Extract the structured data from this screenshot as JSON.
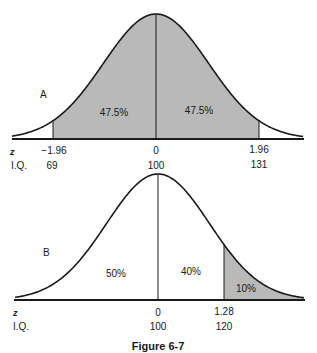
{
  "colors": {
    "shade": "#b9b9b9",
    "line": "#1a1a1a",
    "background": "#ffffff"
  },
  "panels": {
    "A": {
      "label": "A",
      "regions": [
        {
          "label": "47.5%",
          "from_z": -1.96,
          "to_z": 0,
          "shaded": true
        },
        {
          "label": "47.5%",
          "from_z": 0,
          "to_z": 1.96,
          "shaded": true
        }
      ],
      "axis": {
        "z_label": "z",
        "iq_label": "I.Q.",
        "ticks": [
          {
            "z": "−1.96",
            "iq": "69"
          },
          {
            "z": "0",
            "iq": "100"
          },
          {
            "z": "1.96",
            "iq": "131"
          }
        ]
      }
    },
    "B": {
      "label": "B",
      "regions": [
        {
          "label": "50%",
          "from_z": null,
          "to_z": 0,
          "shaded": false
        },
        {
          "label": "40%",
          "from_z": 0,
          "to_z": 1.28,
          "shaded": false
        },
        {
          "label": "10%",
          "from_z": 1.28,
          "to_z": null,
          "shaded": true
        }
      ],
      "axis": {
        "z_label": "z",
        "iq_label": "I.Q.",
        "ticks": [
          {
            "z": "0",
            "iq": "100"
          },
          {
            "z": "1.28",
            "iq": "120"
          }
        ]
      }
    }
  },
  "caption": "Figure 6-7",
  "chart_data": [
    {
      "type": "area",
      "title": "A",
      "description": "Normal curve, shaded between z = -1.96 and z = 1.96",
      "x": [
        -1.96,
        0,
        1.96
      ],
      "x_iq": [
        69,
        100,
        131
      ],
      "regions": [
        {
          "from": -1.96,
          "to": 0,
          "percent": 47.5,
          "shaded": true
        },
        {
          "from": 0,
          "to": 1.96,
          "percent": 47.5,
          "shaded": true
        }
      ],
      "xlabel": "z / I.Q.",
      "ylabel": ""
    },
    {
      "type": "area",
      "title": "B",
      "description": "Normal curve, upper tail shaded above z = 1.28",
      "x": [
        0,
        1.28
      ],
      "x_iq": [
        100,
        120
      ],
      "regions": [
        {
          "from": null,
          "to": 0,
          "percent": 50,
          "shaded": false
        },
        {
          "from": 0,
          "to": 1.28,
          "percent": 40,
          "shaded": false
        },
        {
          "from": 1.28,
          "to": null,
          "percent": 10,
          "shaded": true
        }
      ],
      "xlabel": "z / I.Q.",
      "ylabel": ""
    }
  ]
}
